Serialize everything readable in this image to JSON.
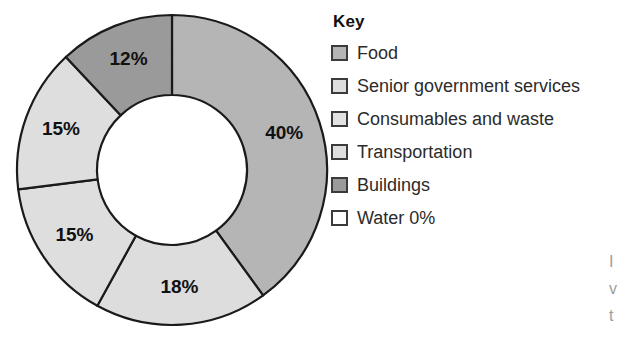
{
  "chart_data": {
    "type": "pie",
    "variant": "donut",
    "title": "",
    "xlabel": "",
    "ylabel": "",
    "legend_position": "right",
    "legend_title": "Key",
    "units": "percent",
    "start_angle_deg": 0,
    "direction": "clockwise",
    "categories": [
      "Food",
      "Consumables and waste",
      "Senior government services",
      "Transportation",
      "Buildings",
      "Water"
    ],
    "values": [
      40,
      18,
      15,
      15,
      12,
      0
    ],
    "slice_labels": [
      "40%",
      "18%",
      "15%",
      "15%",
      "12%",
      ""
    ],
    "colors": [
      "#b5b5b5",
      "#dddddd",
      "#dedede",
      "#dedede",
      "#9a9a9a",
      "#ffffff"
    ],
    "slices": [
      {
        "name": "Food",
        "value": 40,
        "label": "40%",
        "color": "#b5b5b5"
      },
      {
        "name": "Consumables and waste",
        "value": 18,
        "label": "18%",
        "color": "#dddddd"
      },
      {
        "name": "Senior government services",
        "value": 15,
        "label": "15%",
        "color": "#dedede"
      },
      {
        "name": "Transportation",
        "value": 15,
        "label": "15%",
        "color": "#dedede"
      },
      {
        "name": "Buildings",
        "value": 12,
        "label": "12%",
        "color": "#9a9a9a"
      },
      {
        "name": "Water",
        "value": 0,
        "label": "",
        "color": "#ffffff"
      }
    ]
  },
  "legend": {
    "title": "Key",
    "items": [
      {
        "label": "Food",
        "color": "#b5b5b5"
      },
      {
        "label": "Senior government services",
        "color": "#dedede"
      },
      {
        "label": "Consumables and waste",
        "color": "#e2e2e2"
      },
      {
        "label": "Transportation",
        "color": "#dedede"
      },
      {
        "label": "Buildings",
        "color": "#9a9a9a"
      },
      {
        "label": "Water 0%",
        "color": "#ffffff"
      }
    ]
  },
  "margin_text": {
    "line1": "I",
    "line2": "v",
    "line3": "t"
  }
}
